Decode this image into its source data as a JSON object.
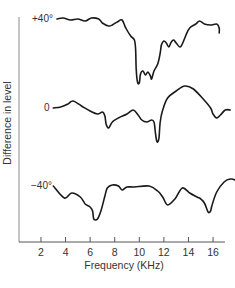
{
  "chart_data": {
    "type": "line",
    "title": "",
    "xlabel": "Frequency (KHz)",
    "ylabel": "Difference in level",
    "x_ticks": [
      2,
      4,
      6,
      8,
      10,
      12,
      14,
      16
    ],
    "xlim": [
      0.5,
      17
    ],
    "grid": false,
    "legend": "none; series labeled inline at left of each curve",
    "note": "Curves are vertically offset; y values are relative deviations (px-scale units, up = positive) from each curve's labeled baseline.",
    "series": [
      {
        "name": "+40°",
        "label": "+40°",
        "baseline_y": 19,
        "points": [
          [
            3.3,
            0
          ],
          [
            3.8,
            1
          ],
          [
            4.4,
            -1
          ],
          [
            5.0,
            0
          ],
          [
            5.6,
            -2
          ],
          [
            6.1,
            1
          ],
          [
            6.7,
            0
          ],
          [
            7.0,
            -4
          ],
          [
            7.5,
            -7
          ],
          [
            7.8,
            -6
          ],
          [
            8.2,
            -3
          ],
          [
            8.6,
            -1
          ],
          [
            8.9,
            -9
          ],
          [
            9.3,
            -17
          ],
          [
            9.6,
            -21
          ],
          [
            9.7,
            -30
          ],
          [
            9.75,
            -50
          ],
          [
            9.85,
            -63
          ],
          [
            10.0,
            -64
          ],
          [
            10.1,
            -55
          ],
          [
            10.3,
            -52
          ],
          [
            10.5,
            -56
          ],
          [
            10.7,
            -53
          ],
          [
            10.9,
            -57
          ],
          [
            11.0,
            -60
          ],
          [
            11.2,
            -52
          ],
          [
            11.5,
            -45
          ],
          [
            11.7,
            -34
          ],
          [
            11.8,
            -26
          ],
          [
            12.0,
            -22
          ],
          [
            12.2,
            -24
          ],
          [
            12.4,
            -28
          ],
          [
            12.6,
            -23
          ],
          [
            12.8,
            -21
          ],
          [
            13.0,
            -24
          ],
          [
            13.3,
            -28
          ],
          [
            13.5,
            -25
          ],
          [
            13.8,
            -16
          ],
          [
            14.1,
            -9
          ],
          [
            14.6,
            -5
          ],
          [
            14.9,
            -2
          ],
          [
            15.3,
            -5
          ],
          [
            15.8,
            -6
          ],
          [
            16.3,
            -5
          ],
          [
            16.5,
            -9
          ],
          [
            16.5,
            -14
          ]
        ]
      },
      {
        "name": "0",
        "label": "0",
        "baseline_y": 108,
        "points": [
          [
            3.0,
            0
          ],
          [
            3.6,
            1
          ],
          [
            4.2,
            4
          ],
          [
            4.6,
            7
          ],
          [
            5.3,
            2
          ],
          [
            6.0,
            -3
          ],
          [
            6.6,
            -6
          ],
          [
            7.0,
            -4
          ],
          [
            7.2,
            -8
          ],
          [
            7.3,
            -16
          ],
          [
            7.5,
            -20
          ],
          [
            7.8,
            -14
          ],
          [
            8.3,
            -10
          ],
          [
            9.0,
            -6
          ],
          [
            9.5,
            -2
          ],
          [
            9.9,
            -7
          ],
          [
            10.2,
            -12
          ],
          [
            10.6,
            -14
          ],
          [
            11.0,
            -12
          ],
          [
            11.2,
            -14
          ],
          [
            11.3,
            -24
          ],
          [
            11.4,
            -32
          ],
          [
            11.5,
            -34
          ],
          [
            11.6,
            -30
          ],
          [
            11.7,
            -14
          ],
          [
            11.9,
            -2
          ],
          [
            12.3,
            10
          ],
          [
            13.0,
            17
          ],
          [
            13.7,
            22
          ],
          [
            14.4,
            19
          ],
          [
            15.2,
            9
          ],
          [
            15.8,
            0
          ],
          [
            16.0,
            -6
          ],
          [
            16.3,
            -10
          ],
          [
            16.6,
            -7
          ],
          [
            17.0,
            -2
          ],
          [
            17.4,
            -2
          ]
        ]
      },
      {
        "name": "−40°",
        "label": "−40°",
        "baseline_y": 186,
        "points": [
          [
            3.0,
            0
          ],
          [
            3.9,
            -12
          ],
          [
            4.5,
            -7
          ],
          [
            5.2,
            -11
          ],
          [
            5.6,
            -18
          ],
          [
            6.0,
            -21
          ],
          [
            6.2,
            -25
          ],
          [
            6.3,
            -33
          ],
          [
            6.6,
            -33
          ],
          [
            6.9,
            -24
          ],
          [
            7.2,
            -10
          ],
          [
            7.4,
            -2
          ],
          [
            7.8,
            1
          ],
          [
            8.3,
            0
          ],
          [
            8.6,
            -4
          ],
          [
            9.0,
            -1
          ],
          [
            9.6,
            -1
          ],
          [
            10.8,
            0
          ],
          [
            11.5,
            -5
          ],
          [
            11.9,
            -11
          ],
          [
            12.3,
            -19
          ],
          [
            12.9,
            -13
          ],
          [
            13.5,
            -2
          ],
          [
            14.1,
            -7
          ],
          [
            14.7,
            -11
          ],
          [
            15.0,
            -13
          ],
          [
            15.3,
            -17
          ],
          [
            15.6,
            -26
          ],
          [
            15.8,
            -25
          ],
          [
            15.9,
            -20
          ],
          [
            16.3,
            -6
          ],
          [
            16.9,
            4
          ],
          [
            17.4,
            7
          ],
          [
            17.9,
            5
          ],
          [
            18.3,
            -3
          ]
        ]
      }
    ]
  },
  "labels": {
    "series_top": "+40°",
    "series_mid": "0",
    "series_bottom": "−40°",
    "xlabel": "Frequency (KHz)",
    "ylabel": "Difference in level",
    "ticks": [
      "2",
      "4",
      "6",
      "8",
      "10",
      "12",
      "14",
      "16"
    ]
  },
  "colors": {
    "curve": "#1a1a1a",
    "axis": "#8a8a8a",
    "text": "#333333"
  }
}
